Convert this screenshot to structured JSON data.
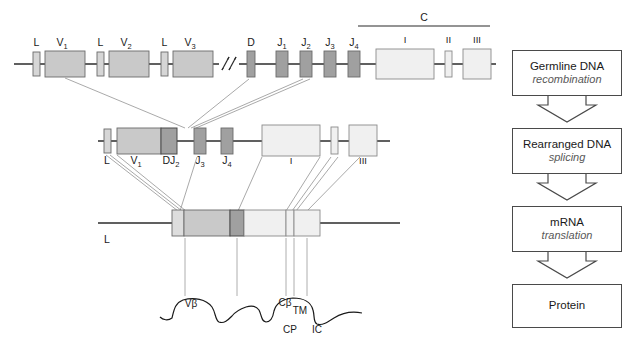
{
  "figure": {
    "colors": {
      "line": "#2b2b2b",
      "v_segment": "#c9c9c9",
      "dj_segment": "#a0a0a0",
      "c_exon": "#f0f0f0",
      "leader": "#d6d6d6",
      "connector": "#9a9a9a",
      "box_border": "#4a4a4a",
      "italic_text": "#585858",
      "text": "#1a1a1a"
    },
    "rows": {
      "germline": {
        "name": "Germline DNA",
        "break_symbol": "//",
        "c_bracket_label": "C",
        "segments": [
          {
            "id": "L1",
            "label": "L",
            "type": "leader"
          },
          {
            "id": "V1",
            "label": "V",
            "sub": "1",
            "type": "v"
          },
          {
            "id": "L2",
            "label": "L",
            "type": "leader"
          },
          {
            "id": "V2",
            "label": "V",
            "sub": "2",
            "type": "v"
          },
          {
            "id": "L3",
            "label": "L",
            "type": "leader"
          },
          {
            "id": "V3",
            "label": "V",
            "sub": "3",
            "type": "v"
          },
          {
            "id": "D",
            "label": "D",
            "type": "dj"
          },
          {
            "id": "J1",
            "label": "J",
            "sub": "1",
            "type": "dj"
          },
          {
            "id": "J2",
            "label": "J",
            "sub": "2",
            "type": "dj"
          },
          {
            "id": "J3",
            "label": "J",
            "sub": "3",
            "type": "dj"
          },
          {
            "id": "J4",
            "label": "J",
            "sub": "4",
            "type": "dj"
          },
          {
            "id": "CI",
            "label": "I",
            "type": "c"
          },
          {
            "id": "CII",
            "label": "II",
            "type": "c"
          },
          {
            "id": "CIII",
            "label": "III",
            "type": "c"
          }
        ]
      },
      "rearranged": {
        "name": "Rearranged DNA",
        "segments": [
          {
            "id": "L",
            "label": "L",
            "type": "leader"
          },
          {
            "id": "V1",
            "label": "V",
            "sub": "1",
            "type": "v"
          },
          {
            "id": "DJ2",
            "label": "DJ",
            "sub": "2",
            "type": "dj"
          },
          {
            "id": "J3",
            "label": "J",
            "sub": "3",
            "type": "dj"
          },
          {
            "id": "J4",
            "label": "J",
            "sub": "4",
            "type": "dj"
          },
          {
            "id": "CI",
            "label": "I",
            "type": "c"
          },
          {
            "id": "CII",
            "label": "",
            "type": "c"
          },
          {
            "id": "CIII",
            "label": "III",
            "type": "c"
          }
        ]
      },
      "mrna": {
        "name": "mRNA",
        "leader_label": "L"
      }
    },
    "protein": {
      "domains": [
        {
          "id": "vbeta",
          "label": "Vβ"
        },
        {
          "id": "cbeta",
          "label": "Cβ"
        }
      ],
      "regions": [
        {
          "id": "tm",
          "label": "TM"
        },
        {
          "id": "cp",
          "label": "CP"
        },
        {
          "id": "ic",
          "label": "IC"
        }
      ]
    }
  },
  "flowchart": {
    "steps": [
      {
        "id": "germline",
        "title": "Germline DNA",
        "process": "recombination"
      },
      {
        "id": "rearranged",
        "title": "Rearranged DNA",
        "process": "splicing"
      },
      {
        "id": "mrna",
        "title": "mRNA",
        "process": "translation"
      },
      {
        "id": "protein",
        "title": "Protein",
        "process": ""
      }
    ]
  }
}
